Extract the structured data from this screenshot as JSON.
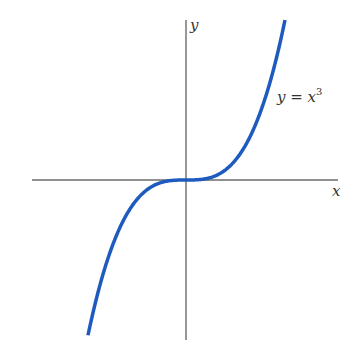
{
  "figure": {
    "x_axis_label": "x",
    "y_axis_label": "y",
    "curve_label": "y = x",
    "curve_label_exponent": "3",
    "colors": {
      "curve": "#1f5bbf",
      "axes": "#6b6b6b",
      "text": "#333333"
    }
  },
  "chart_data": {
    "type": "line",
    "title": "",
    "xlabel": "x",
    "ylabel": "y",
    "series": [
      {
        "name": "y = x^3",
        "function": "x^3",
        "x": [
          -1.0,
          -0.75,
          -0.5,
          -0.25,
          0,
          0.25,
          0.5,
          0.75,
          1.0
        ],
        "values": [
          -1.0,
          -0.421875,
          -0.125,
          -0.015625,
          0,
          0.015625,
          0.125,
          0.421875,
          1.0
        ]
      }
    ],
    "grid": false,
    "ticks": "none"
  }
}
